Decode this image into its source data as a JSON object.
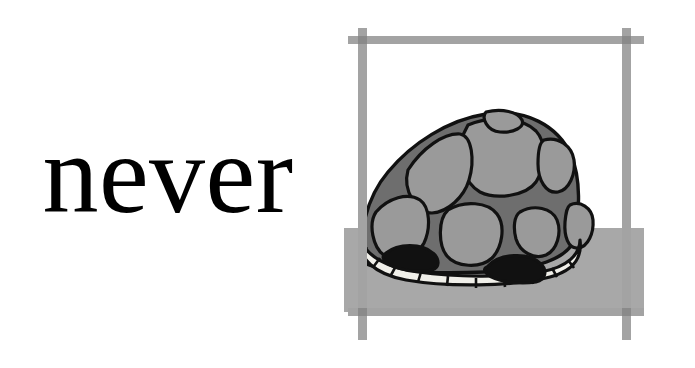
{
  "page": {
    "width": 695,
    "height": 368,
    "background_color": "#ffffff",
    "type": "flashcard",
    "layout": "word-left-illustration-right"
  },
  "word_panel": {
    "word": "never",
    "text_color": "#000000",
    "style": "serif-lowercase"
  },
  "illustration": {
    "subject": "turtle hiding in its shell",
    "alt_text": "A turtle withdrawn into its domed shell, sitting on the ground inside a hand-drawn square frame",
    "colors": {
      "frame_bar": "#a3a3a3",
      "frame_bar_overlap": "#8a8a8a",
      "ground": "#a8a8a8",
      "shell_base": "#6e6e6e",
      "shell_scute": "#9a9a9a",
      "plastron_rim": "#f0efe9",
      "opening_dark": "#111111",
      "outline": "#111111",
      "sky": "#ffffff"
    },
    "frame": {
      "name": "brush-stroke-square-frame",
      "left_x": 8,
      "right_x": 308,
      "top_y": 28,
      "bottom_y": 312,
      "bar_thickness": 9
    },
    "ground": {
      "horizon_y": 228,
      "bottom_y": 312
    },
    "turtle": {
      "shell_left_x": 25,
      "shell_right_x": 240,
      "shell_top_y": 112,
      "shell_bottom_y": 268,
      "scute_count": 10,
      "rim_segment_count": 11,
      "opening_count": 2
    }
  }
}
